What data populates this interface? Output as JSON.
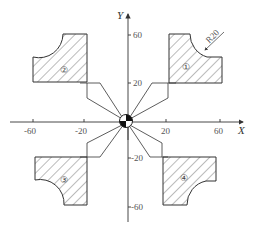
{
  "diagram": {
    "type": "technical-drawing",
    "axes": {
      "x_label": "X",
      "y_label": "Y",
      "x_ticks": [
        "-60",
        "-20",
        "20",
        "60"
      ],
      "y_ticks": [
        "60",
        "20",
        "-20",
        "-60"
      ]
    },
    "parts": [
      {
        "id": "1",
        "label": "①",
        "quadrant": "I"
      },
      {
        "id": "2",
        "label": "②",
        "quadrant": "II"
      },
      {
        "id": "3",
        "label": "③",
        "quadrant": "III"
      },
      {
        "id": "4",
        "label": "④",
        "quadrant": "IV"
      }
    ],
    "annotation": {
      "radius_label": "R20"
    },
    "colors": {
      "line": "#333333",
      "hatch": "#555555",
      "background": "#ffffff"
    }
  }
}
